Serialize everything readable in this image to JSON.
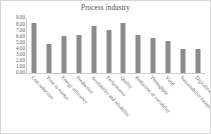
{
  "chart_data": {
    "type": "bar",
    "title": "Process industry",
    "xlabel": "",
    "ylabel": "",
    "ylim": [
      0,
      9
    ],
    "grid": false,
    "legend": false,
    "y_ticks": [
      "9.00",
      "8.00",
      "7.00",
      "6.00",
      "5.00",
      "4.00",
      "3.00",
      "2.00",
      "1.00",
      "0.00"
    ],
    "y_tick_values": [
      9,
      8,
      7,
      6,
      5,
      4,
      3,
      2,
      1,
      0
    ],
    "categories": [
      "Cost reduction",
      "Time to market",
      "Energy efficiency",
      "Production",
      "Availability and reliability",
      "Performance",
      "Quality",
      "Reduction of variability",
      "Throughput",
      "Yield",
      "Sustainability footprint",
      "Digitalization"
    ],
    "values": [
      8.2,
      4.8,
      6.1,
      6.3,
      7.7,
      7.0,
      8.2,
      6.2,
      5.7,
      5.3,
      4.0,
      3.9
    ],
    "bar_color": "#8c8c8c",
    "axis_color": "#cfcfcf",
    "text_color": "#5a5a5a",
    "background": "#ffffff",
    "border_color": "#d6d6d6"
  }
}
